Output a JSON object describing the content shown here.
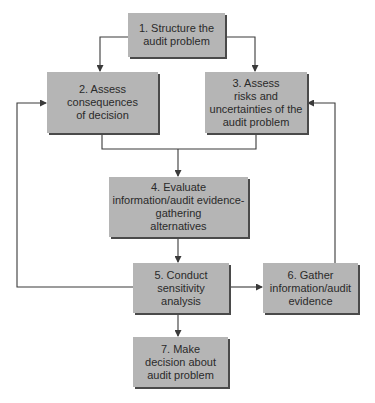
{
  "diagram": {
    "colors": {
      "box_fill": "#b5b5b5",
      "box_shadow": "#4a4a4a",
      "line": "#3a3a3a",
      "text": "#2a2a2a"
    },
    "nodes": [
      {
        "id": "1",
        "label": "1. Structure the\naudit problem"
      },
      {
        "id": "2",
        "label": "2. Assess\nconsequences\nof decision"
      },
      {
        "id": "3",
        "label": "3. Assess\nrisks and\nuncertainties of the\naudit problem"
      },
      {
        "id": "4",
        "label": "4. Evaluate\ninformation/audit evidence-\ngathering\nalternatives"
      },
      {
        "id": "5",
        "label": "5. Conduct\nsensitivity\nanalysis"
      },
      {
        "id": "6",
        "label": "6. Gather\ninformation/audit\nevidence"
      },
      {
        "id": "7",
        "label": "7. Make\ndecision about\naudit problem"
      }
    ],
    "edges": [
      {
        "from": "1",
        "to": "2"
      },
      {
        "from": "1",
        "to": "3"
      },
      {
        "from": "2",
        "to": "4"
      },
      {
        "from": "3",
        "to": "4"
      },
      {
        "from": "4",
        "to": "5"
      },
      {
        "from": "5",
        "to": "2"
      },
      {
        "from": "5",
        "to": "6"
      },
      {
        "from": "6",
        "to": "3"
      },
      {
        "from": "5",
        "to": "7"
      }
    ]
  }
}
